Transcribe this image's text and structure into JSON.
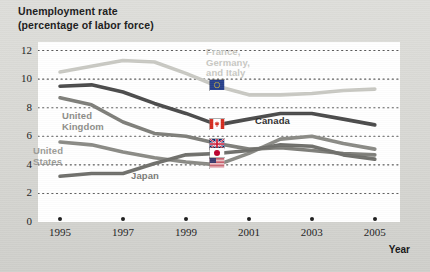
{
  "title": {
    "line1": "Unemployment rate",
    "line2": "(percentage of labor force)"
  },
  "axis": {
    "x_name": "Year",
    "y_ticks": [
      "12",
      "10",
      "8",
      "6",
      "4",
      "2",
      "0"
    ],
    "x_ticks": [
      "1995",
      "1997",
      "1999",
      "2001",
      "2003",
      "2005"
    ]
  },
  "series_labels": [
    {
      "name": "france-germany-italy",
      "text": "France,\nGermany,\nand Italy",
      "color": "#c8c8c3",
      "x": 206,
      "y": 47
    },
    {
      "name": "canada",
      "text": "Canada",
      "color": "#2c2c2c",
      "x": 255,
      "y": 116
    },
    {
      "name": "united-kingdom",
      "text": "United\nKingdom",
      "color": "#8d8d88",
      "x": 62,
      "y": 111
    },
    {
      "name": "united-states",
      "text": "United\nStates",
      "color": "#9a9a95",
      "x": 33,
      "y": 146
    },
    {
      "name": "japan",
      "text": "Japan",
      "color": "#7a7a76",
      "x": 131,
      "y": 171
    }
  ],
  "flags": [
    {
      "name": "eu-flag",
      "series": "France, Germany, and Italy",
      "year": 2000,
      "value": 9.6
    },
    {
      "name": "canada-flag",
      "series": "Canada",
      "year": 2000,
      "value": 6.85
    },
    {
      "name": "united-kingdom-flag",
      "series": "United Kingdom",
      "year": 2000,
      "value": 5.45
    },
    {
      "name": "japan-flag",
      "series": "Japan",
      "year": 2000,
      "value": 4.85
    },
    {
      "name": "united-states-flag",
      "series": "United States",
      "year": 2000,
      "value": 4.15
    }
  ],
  "chart_data": {
    "type": "line",
    "title": "Unemployment rate (percentage of labor force)",
    "xlabel": "Year",
    "ylabel": "Unemployment rate (percentage of labor force)",
    "x": [
      1995,
      1996,
      1997,
      1998,
      1999,
      2000,
      2001,
      2002,
      2003,
      2004,
      2005
    ],
    "xlim": [
      1994.3,
      2005.8
    ],
    "ylim": [
      0,
      12.6
    ],
    "grid": "horizontal-dotted",
    "legend": "inline-labels",
    "series": [
      {
        "name": "France, Germany, and Italy",
        "color": "#c9c9c3",
        "values": [
          10.5,
          10.9,
          11.3,
          11.2,
          10.4,
          9.5,
          8.9,
          8.9,
          9.0,
          9.2,
          9.3
        ]
      },
      {
        "name": "Canada",
        "color": "#4a4a4a",
        "values": [
          9.5,
          9.6,
          9.1,
          8.3,
          7.6,
          6.8,
          7.2,
          7.6,
          7.6,
          7.2,
          6.8
        ]
      },
      {
        "name": "United Kingdom",
        "color": "#7e7e79",
        "values": [
          8.7,
          8.2,
          7.0,
          6.2,
          6.0,
          5.5,
          5.1,
          5.2,
          5.0,
          4.8,
          4.7
        ]
      },
      {
        "name": "United States",
        "color": "#8a8a85",
        "values": [
          5.6,
          5.4,
          4.9,
          4.5,
          4.2,
          4.0,
          4.8,
          5.8,
          6.0,
          5.5,
          5.1
        ]
      },
      {
        "name": "Japan",
        "color": "#6f6f6b",
        "values": [
          3.2,
          3.4,
          3.4,
          4.1,
          4.7,
          4.8,
          5.0,
          5.4,
          5.3,
          4.7,
          4.4
        ]
      }
    ]
  }
}
